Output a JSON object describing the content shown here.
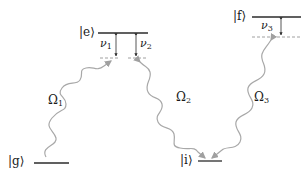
{
  "diagram": {
    "type": "energy-level-diagram",
    "colors": {
      "level_line": "#2b2b2b",
      "dashed_line": "#888888",
      "detuning_arrow": "#2b2b2b",
      "wave": "#a8a8a8",
      "text": "#1a1a1a"
    },
    "levels": [
      {
        "id": "g",
        "label": "|g⟩"
      },
      {
        "id": "e",
        "label": "|e⟩"
      },
      {
        "id": "i",
        "label": "|i⟩"
      },
      {
        "id": "f",
        "label": "|f⟩"
      }
    ],
    "detunings": [
      {
        "id": "nu1",
        "symbol": "ν",
        "sub": "1"
      },
      {
        "id": "nu2",
        "symbol": "ν",
        "sub": "2"
      },
      {
        "id": "nu3",
        "symbol": "ν",
        "sub": "3"
      }
    ],
    "couplings": [
      {
        "id": "omega1",
        "symbol": "Ω",
        "sub": "1",
        "from": "g",
        "to": "e"
      },
      {
        "id": "omega2",
        "symbol": "Ω",
        "sub": "2",
        "from": "e",
        "to": "i"
      },
      {
        "id": "omega3",
        "symbol": "Ω",
        "sub": "3",
        "from": "f",
        "to": "i"
      }
    ]
  }
}
